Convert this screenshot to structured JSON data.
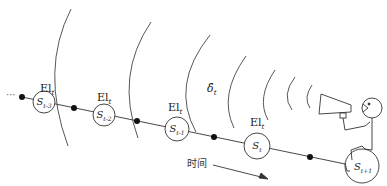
{
  "diagram": {
    "type": "state-chain-with-broadcast",
    "leading_ellipsis": "···",
    "states": [
      {
        "base": "S",
        "sub": "t-3",
        "label": "El",
        "label_sub": "t"
      },
      {
        "base": "S",
        "sub": "t-2",
        "label": "El",
        "label_sub": "t"
      },
      {
        "base": "S",
        "sub": "t-1",
        "label": "El",
        "label_sub": "t"
      },
      {
        "base": "S",
        "sub": "t",
        "label": "El",
        "label_sub": "t"
      },
      {
        "base": "S",
        "sub": "t+1"
      }
    ],
    "signal_label": {
      "base": "δ̂",
      "sub": "t"
    },
    "time_axis_label": "时间",
    "broadcaster": "megaphone-figure",
    "colors": {
      "line": "#333333",
      "node_fill": "#ffffff",
      "dot": "#111111",
      "background": "#ffffff"
    }
  }
}
